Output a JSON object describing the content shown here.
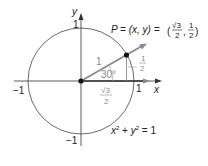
{
  "diagram": {
    "axes": {
      "x_label": "x",
      "y_label": "y",
      "x_pos_tick": "1",
      "x_neg_tick": "−1",
      "y_pos_tick": "1",
      "y_neg_tick": "−1"
    },
    "point": {
      "equation_prefix": "P = (x, y) = ",
      "x_num": "√3",
      "x_den": "2",
      "y_num": "1",
      "y_den": "2"
    },
    "ray_label": "1",
    "angle_label": "30°",
    "opposite": {
      "num": "1",
      "den": "2"
    },
    "adjacent": {
      "num": "√3",
      "den": "2"
    },
    "circle_equation": {
      "x": "x",
      "y": "y",
      "exp": "2",
      "rest": " = 1",
      "plus": " + "
    },
    "colors": {
      "line": "#333333",
      "ray": "#8a8a8a",
      "label_grey": "#8a8a8a"
    }
  }
}
